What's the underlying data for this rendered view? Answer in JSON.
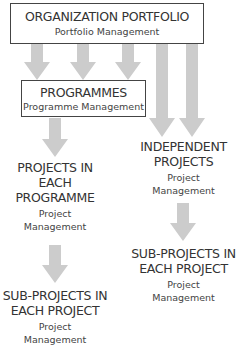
{
  "diagram": {
    "arrow_color": "#cccccc",
    "border_color": "#444444",
    "nodes": {
      "portfolio": {
        "title": "ORGANIZATION PORTFOLIO",
        "subtitle": "Portfolio Management"
      },
      "programmes": {
        "title": "PROGRAMMES",
        "subtitle": "Programme Management"
      },
      "projects_in_programme": {
        "title_lines": [
          "PROJECTS IN",
          "EACH",
          "PROGRAMME"
        ],
        "subtitle_lines": [
          "Project",
          "Management"
        ]
      },
      "independent_projects": {
        "title_lines": [
          "INDEPENDENT",
          "PROJECTS"
        ],
        "subtitle_lines": [
          "Project",
          "Management"
        ]
      },
      "sub_projects_left": {
        "title_lines": [
          "SUB-PROJECTS IN",
          "EACH PROJECT"
        ],
        "subtitle_lines": [
          "Project",
          "Management"
        ]
      },
      "sub_projects_right": {
        "title_lines": [
          "SUB-PROJECTS IN",
          "EACH PROJECT"
        ],
        "subtitle_lines": [
          "Project",
          "Management"
        ]
      }
    },
    "edges": [
      {
        "from": "portfolio",
        "to": "programmes"
      },
      {
        "from": "portfolio",
        "to": "programmes"
      },
      {
        "from": "portfolio",
        "to": "programmes"
      },
      {
        "from": "portfolio",
        "to": "independent_projects"
      },
      {
        "from": "portfolio",
        "to": "independent_projects"
      },
      {
        "from": "programmes",
        "to": "projects_in_programme"
      },
      {
        "from": "projects_in_programme",
        "to": "sub_projects_left"
      },
      {
        "from": "independent_projects",
        "to": "sub_projects_right"
      }
    ]
  }
}
